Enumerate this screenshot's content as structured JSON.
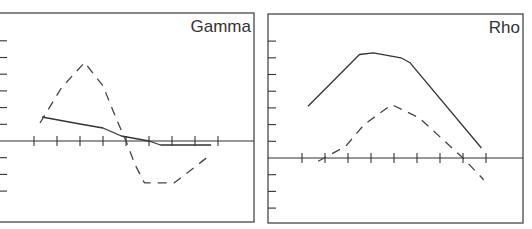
{
  "chart_data": [
    {
      "type": "line",
      "title": "Gamma",
      "xlabel": "",
      "ylabel": "",
      "grid": false,
      "legend": null,
      "x_ticks": [
        0,
        1,
        2,
        3,
        4,
        5,
        6,
        7,
        8
      ],
      "y_ticks": [
        -3,
        -2,
        -1,
        0,
        1,
        2,
        3,
        4,
        5,
        6
      ],
      "xlim": [
        -1.5,
        9.0
      ],
      "ylim": [
        -4.8,
        7.6
      ],
      "series": [
        {
          "name": "solid",
          "style": "solid",
          "x": [
            0.35,
            2.0,
            3.0,
            3.8,
            5.0,
            5.5,
            7.7
          ],
          "y": [
            1.44,
            1.02,
            0.78,
            0.3,
            0.0,
            -0.24,
            -0.24
          ]
        },
        {
          "name": "dashed",
          "style": "dashed",
          "x": [
            0.26,
            1.2,
            2.2,
            3.0,
            3.6,
            4.0,
            4.4,
            4.8,
            6.1,
            7.7
          ],
          "y": [
            1.08,
            3.2,
            4.7,
            3.3,
            1.26,
            0.0,
            -1.44,
            -2.5,
            -2.5,
            -0.8
          ]
        }
      ]
    },
    {
      "type": "line",
      "title": "Rho",
      "xlabel": "",
      "ylabel": "",
      "grid": false,
      "legend": null,
      "x_ticks": [
        0,
        1,
        2,
        3,
        4,
        5,
        6,
        7,
        8
      ],
      "y_ticks": [
        -3,
        -2,
        -1,
        0,
        1,
        2,
        3,
        4,
        5,
        6,
        7
      ],
      "xlim": [
        -1.5,
        9.3
      ],
      "ylim": [
        -3.9,
        8.7
      ],
      "series": [
        {
          "name": "solid",
          "style": "solid",
          "x": [
            0.26,
            2.5,
            3.1,
            4.3,
            4.7,
            7.8
          ],
          "y": [
            3.1,
            6.2,
            6.3,
            6.0,
            5.7,
            0.6
          ]
        },
        {
          "name": "dashed",
          "style": "dashed",
          "x": [
            0.7,
            1.9,
            2.7,
            3.9,
            5.1,
            7.0,
            7.9
          ],
          "y": [
            -0.2,
            0.7,
            2.0,
            3.2,
            2.4,
            0.0,
            -1.3
          ]
        }
      ]
    }
  ],
  "panels": [
    {
      "title": "Gamma",
      "frame": {
        "x0": -2,
        "y0": 13,
        "x1": 254,
        "y1": 222
      },
      "x_origin_px": 34,
      "x_unit_px": 23,
      "zero_y_px": 141,
      "y_unit_px": 16.7,
      "axis_x_from": -2,
      "axis_x_to": 254,
      "y_tick_px_x0": 0,
      "y_tick_px_x1": 7
    },
    {
      "title": "Rho",
      "frame": {
        "x0": 268,
        "y0": 14,
        "x1": 523,
        "y1": 223
      },
      "x_origin_px": 302,
      "x_unit_px": 23,
      "zero_y_px": 158,
      "y_unit_px": 16.7,
      "axis_x_from": 268,
      "axis_x_to": 523,
      "y_tick_px_x0": 268,
      "y_tick_px_x1": 276
    }
  ],
  "colors": {
    "line": "#333333",
    "frame": "#555555",
    "background": "#ffffff"
  }
}
